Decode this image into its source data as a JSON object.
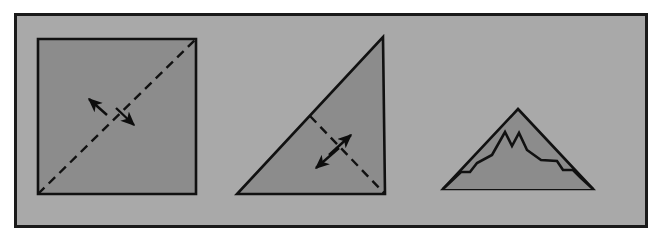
{
  "page": {
    "title": "Lines of symmetry figures",
    "background_color": "#ffffff",
    "width": 666,
    "height": 243
  },
  "frame": {
    "label": "figure-panel",
    "fill_color": "#a9a9a9",
    "stroke_color": "#1a1a1a",
    "x": 14,
    "y": 13,
    "width": 634,
    "height": 215,
    "stroke_width": 3
  },
  "style": {
    "shape_fill": "#8c8c8c",
    "shape_stroke": "#111111",
    "dash_stroke": "#111111",
    "arrow_color": "#0d0d0d",
    "shape_stroke_width": 2.6,
    "dash_pattern": "9 6",
    "dash_width": 2.4
  },
  "figures": [
    {
      "id": "figure-1",
      "name": "square-with-diagonal-line-of-symmetry",
      "shape": "square",
      "label": "Square",
      "symmetry_line": "diagonal bottom-left to top-right",
      "has_symmetry": true,
      "arrow_count": 2,
      "points": "38,39 196,39 196,194 38,194",
      "dash_from": [
        38,
        194
      ],
      "dash_to": [
        196,
        39
      ],
      "arrows": [
        {
          "name": "arrow-upper-left",
          "x1": 107,
          "y1": 115,
          "x2": 89,
          "y2": 99
        },
        {
          "name": "arrow-lower-right",
          "x1": 116,
          "y1": 108,
          "x2": 134,
          "y2": 125
        }
      ]
    },
    {
      "id": "figure-2",
      "name": "right-triangle-with-line-of-symmetry",
      "shape": "right-triangle",
      "label": "Right triangle",
      "symmetry_line": "hypotenuse midpoint to right-angle vertex",
      "has_symmetry": true,
      "arrow_count": 2,
      "points": "383,37 385,194 237,194",
      "dash_from": [
        310,
        116
      ],
      "dash_to": [
        385,
        194
      ],
      "arrows": [
        {
          "name": "arrow-upper-right",
          "x1": 329,
          "y1": 155,
          "x2": 351,
          "y2": 135
        },
        {
          "name": "arrow-lower-left",
          "x1": 339,
          "y1": 148,
          "x2": 316,
          "y2": 168
        }
      ]
    },
    {
      "id": "figure-3",
      "name": "mountain-outline-no-line-of-symmetry",
      "shape": "mountain",
      "label": "Mountain",
      "symmetry_line": "none",
      "has_symmetry": false,
      "arrow_count": 0,
      "outer_points": "518,109 593,189 443,189",
      "inner_points": "443,189 461,172 470,172 477,163 492,155 505,132 512,146 519,133 527,150 541,160 557,161 563,170 573,170 581,178 593,189"
    }
  ],
  "chart_data": {
    "type": "diagram",
    "title": "Lines of symmetry",
    "panel_count": 1,
    "figure_count": 3,
    "figures": [
      {
        "name": "square",
        "lines_of_symmetry_shown": 1,
        "arrows": 2
      },
      {
        "name": "right triangle",
        "lines_of_symmetry_shown": 1,
        "arrows": 2
      },
      {
        "name": "mountain",
        "lines_of_symmetry_shown": 0,
        "arrows": 0
      }
    ]
  }
}
